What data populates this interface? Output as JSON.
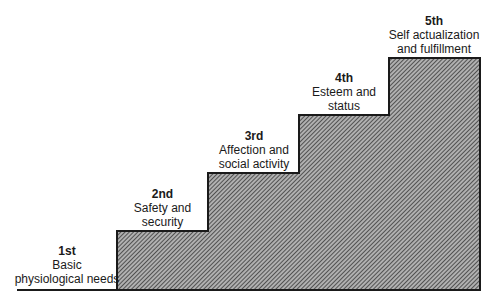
{
  "diagram": {
    "type": "staircase",
    "fill_color": "#8a8a8a",
    "line_color": "#1a1a1a",
    "steps": [
      {
        "rank": "1st",
        "line1": "Basic",
        "line2": "physiological needs"
      },
      {
        "rank": "2nd",
        "line1": "Safety and",
        "line2": "security"
      },
      {
        "rank": "3rd",
        "line1": "Affection and",
        "line2": "social activity"
      },
      {
        "rank": "4th",
        "line1": "Esteem and",
        "line2": "status"
      },
      {
        "rank": "5th",
        "line1": "Self actualization",
        "line2": "and fulfillment"
      }
    ]
  }
}
